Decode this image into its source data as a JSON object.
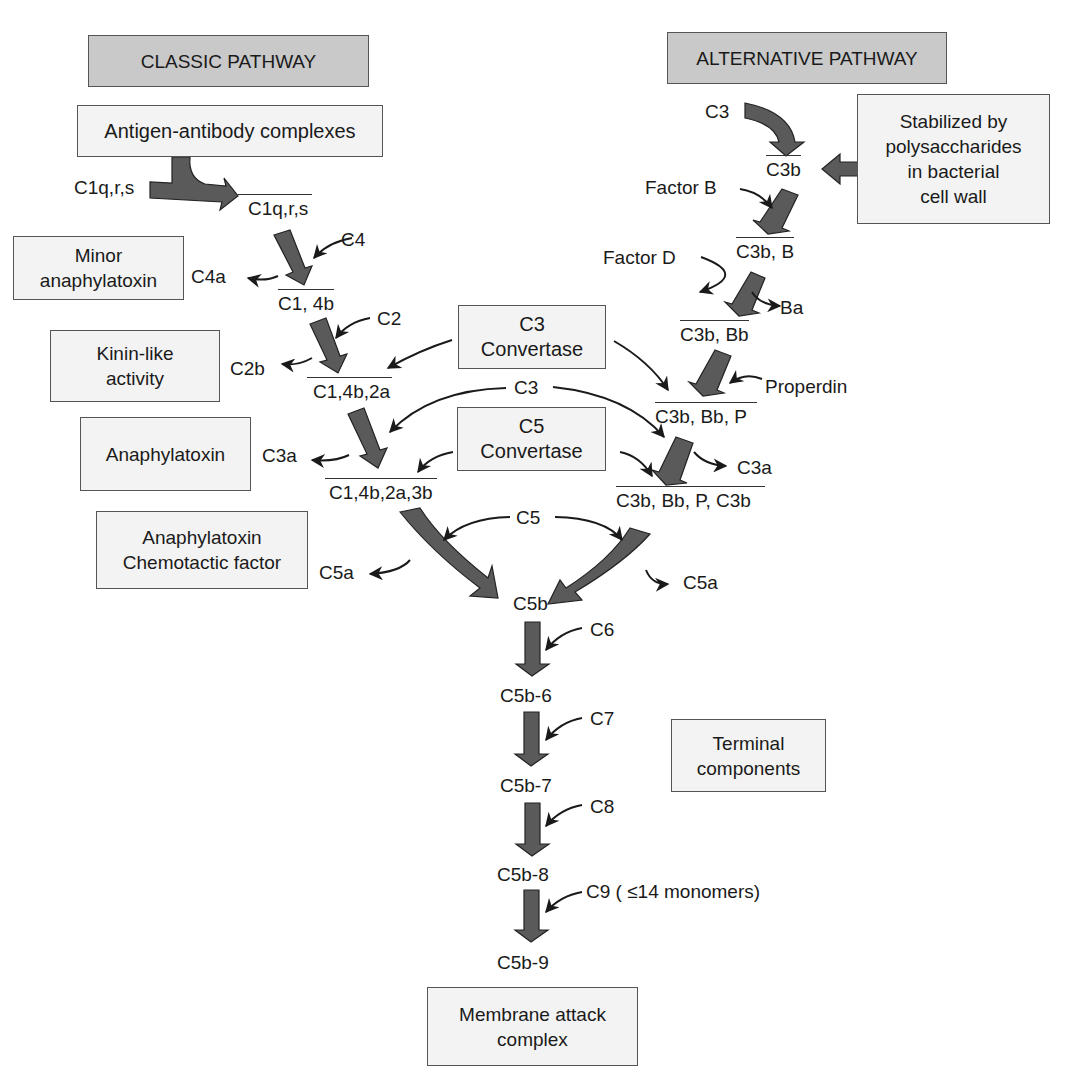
{
  "headers": {
    "classic": "CLASSIC PATHWAY",
    "alternative": "ALTERNATIVE PATHWAY"
  },
  "boxes": {
    "antigen": "Antigen-antibody complexes",
    "stabilized": "Stabilized by\npolysaccharides\nin bacterial\ncell wall",
    "minor": "Minor\nanaphylatoxin",
    "kinin": "Kinin-like\nactivity",
    "anaphylatoxin": "Anaphylatoxin",
    "chemotactic": "Anaphylatoxin\nChemotactic factor",
    "c3conv": "C3\nConvertase",
    "c5conv": "C5\nConvertase",
    "terminal": "Terminal\ncomponents",
    "mac": "Membrane attack\ncomplex"
  },
  "classic": {
    "c1qrs_in": "C1q,r,s",
    "c1qrs": "C1q,r,s",
    "c4": "C4",
    "c4a": "C4a",
    "c14b": "C1, 4b",
    "c2": "C2",
    "c2b": "C2b",
    "c14b2a": "C1,4b,2a",
    "c3a": "C3a",
    "c14b2a3b": "C1,4b,2a,3b",
    "c5a": "C5a"
  },
  "alternative": {
    "c3": "C3",
    "c3b": "C3b",
    "factor_b": "Factor B",
    "c3bB": "C3b, B",
    "factor_d": "Factor D",
    "ba": "Ba",
    "c3bBb": "C3b, Bb",
    "properdin": "Properdin",
    "c3bBbP": "C3b, Bb, P",
    "c3a": "C3a",
    "c3bBbPC3b": "C3b, Bb, P, C3b",
    "c5a": "C5a"
  },
  "shared": {
    "c3": "C3",
    "c5": "C5"
  },
  "terminal": {
    "c5b": "C5b",
    "c6": "C6",
    "c5b6": "C5b-6",
    "c7": "C7",
    "c5b7": "C5b-7",
    "c8": "C8",
    "c5b8": "C5b-8",
    "c9": "C9 ( ≤14 monomers)",
    "c5b9": "C5b-9"
  },
  "colors": {
    "arrow_fill": "#5a5a5a",
    "header_fill": "#c9c9c9",
    "box_fill": "#f3f3f3"
  }
}
